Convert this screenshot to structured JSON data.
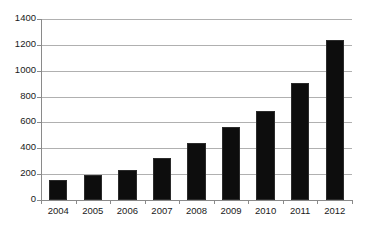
{
  "chart_data": {
    "type": "bar",
    "title": "",
    "subtitle": "",
    "xlabel": "",
    "ylabel": "",
    "categories": [
      "2004",
      "2005",
      "2006",
      "2007",
      "2008",
      "2009",
      "2010",
      "2011",
      "2012"
    ],
    "values": [
      155,
      190,
      230,
      325,
      440,
      565,
      685,
      905,
      1240
    ],
    "series": [
      {
        "name": "",
        "values": [
          155,
          190,
          230,
          325,
          440,
          565,
          685,
          905,
          1240
        ]
      }
    ],
    "ylim": [
      0,
      1400
    ],
    "ytick_labels": [
      "0",
      "200",
      "400",
      "600",
      "800",
      "1000",
      "1200",
      "1400"
    ],
    "ytick_values": [
      0,
      200,
      400,
      600,
      800,
      1000,
      1200,
      1400
    ],
    "grid": "horizontal",
    "legend": "none",
    "bar_color": "#0d0d0d",
    "gridline_color": "#b0b0b0",
    "axis_color": "#8a8a8a",
    "text_color": "#1a1a1a",
    "background": "#ffffff"
  }
}
